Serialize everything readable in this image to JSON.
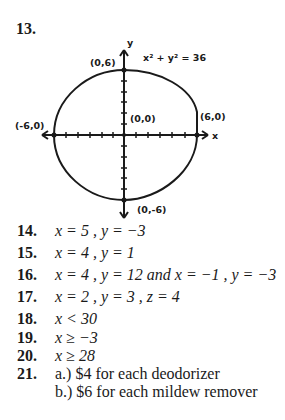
{
  "problem_13": {
    "number": "13.",
    "graph": {
      "equation": "x² + y² = 36",
      "x_axis_label": "x",
      "y_axis_label": "y",
      "points": [
        {
          "label": "(0,6)",
          "x": 0,
          "y": 6
        },
        {
          "label": "(-6,0)",
          "x": -6,
          "y": 0
        },
        {
          "label": "(0,0)",
          "x": 0,
          "y": 0
        },
        {
          "label": "(6,0)",
          "x": 6,
          "y": 0
        },
        {
          "label": "(0,-6)",
          "x": 0,
          "y": -6
        }
      ]
    }
  },
  "answers": [
    {
      "number": "14.",
      "text": "x = 5 ,  y = −3"
    },
    {
      "number": "15.",
      "text": "x = 4 ,  y = 1"
    },
    {
      "number": "16.",
      "text": "x = 4 ,  y = 12  and  x = −1 ,  y = −3"
    },
    {
      "number": "17.",
      "text": "x = 2 ,  y = 3 ,  z = 4"
    },
    {
      "number": "18.",
      "text": "x < 30"
    },
    {
      "number": "19.",
      "text": "x ≥ −3"
    },
    {
      "number": "20.",
      "text": "x ≥ 28"
    },
    {
      "number": "21.",
      "text": "a.) $4 for each deodorizer"
    },
    {
      "number": "",
      "text": "b.) $6 for each mildew remover"
    }
  ]
}
